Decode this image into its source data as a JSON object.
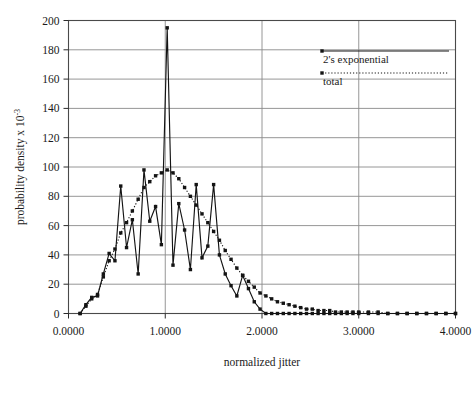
{
  "chart_data": {
    "type": "line",
    "title": "",
    "xlabel": "normalized jitter",
    "ylabel": "probability density x 10-3",
    "ylabel_base": "probability density x  10",
    "ylabel_exp": "-3",
    "xlim": [
      0.0,
      4.0
    ],
    "ylim": [
      0,
      200
    ],
    "xticks": [
      0.0,
      1.0,
      2.0,
      3.0,
      4.0
    ],
    "xtick_labels": [
      "0.0000",
      "1.0000",
      "2.0000",
      "3.0000",
      "4.0000"
    ],
    "yticks": [
      0,
      20,
      40,
      60,
      80,
      100,
      120,
      140,
      160,
      180,
      200
    ],
    "ytick_labels": [
      "0",
      "20",
      "40",
      "60",
      "80",
      "100",
      "120",
      "140",
      "160",
      "180",
      "200"
    ],
    "grid": "both",
    "grid_color": "#8a8a8a",
    "legend_position": "top-right",
    "series": [
      {
        "name": "2's exponential",
        "style": "solid",
        "color": "#141414",
        "marker": "square",
        "points": [
          [
            0.12,
            0
          ],
          [
            0.18,
            6
          ],
          [
            0.24,
            11
          ],
          [
            0.3,
            12
          ],
          [
            0.36,
            27
          ],
          [
            0.42,
            41
          ],
          [
            0.48,
            36
          ],
          [
            0.54,
            87
          ],
          [
            0.6,
            45
          ],
          [
            0.66,
            64
          ],
          [
            0.72,
            27
          ],
          [
            0.78,
            98
          ],
          [
            0.84,
            63
          ],
          [
            0.9,
            73
          ],
          [
            0.96,
            47
          ],
          [
            1.02,
            195
          ],
          [
            1.08,
            33
          ],
          [
            1.14,
            75
          ],
          [
            1.2,
            57
          ],
          [
            1.26,
            30
          ],
          [
            1.32,
            88
          ],
          [
            1.38,
            38
          ],
          [
            1.44,
            46
          ],
          [
            1.5,
            88
          ],
          [
            1.56,
            40
          ],
          [
            1.62,
            27
          ],
          [
            1.68,
            19
          ],
          [
            1.74,
            12
          ],
          [
            1.8,
            26
          ],
          [
            1.86,
            17
          ],
          [
            1.92,
            8
          ],
          [
            1.98,
            3
          ],
          [
            2.04,
            0
          ],
          [
            2.1,
            0
          ],
          [
            2.16,
            0
          ],
          [
            2.22,
            0
          ],
          [
            2.28,
            0
          ],
          [
            2.34,
            0
          ],
          [
            2.4,
            0
          ],
          [
            2.46,
            0
          ],
          [
            2.52,
            0
          ],
          [
            2.58,
            0
          ],
          [
            2.64,
            0
          ],
          [
            2.7,
            0
          ],
          [
            2.76,
            0
          ],
          [
            2.82,
            0
          ],
          [
            2.88,
            0
          ],
          [
            2.94,
            0
          ],
          [
            3.0,
            0
          ],
          [
            3.1,
            0
          ],
          [
            3.2,
            0
          ],
          [
            3.3,
            0
          ],
          [
            3.4,
            0
          ],
          [
            3.5,
            0
          ],
          [
            3.6,
            0
          ],
          [
            3.7,
            0
          ],
          [
            3.8,
            0
          ],
          [
            3.9,
            0
          ],
          [
            4.0,
            0
          ]
        ]
      },
      {
        "name": "total",
        "style": "dotted",
        "color": "#141414",
        "marker": "square",
        "points": [
          [
            0.12,
            0
          ],
          [
            0.18,
            5
          ],
          [
            0.24,
            10
          ],
          [
            0.3,
            13
          ],
          [
            0.36,
            25
          ],
          [
            0.42,
            36
          ],
          [
            0.48,
            44
          ],
          [
            0.54,
            55
          ],
          [
            0.6,
            62
          ],
          [
            0.66,
            70
          ],
          [
            0.72,
            78
          ],
          [
            0.78,
            86
          ],
          [
            0.84,
            90
          ],
          [
            0.9,
            94
          ],
          [
            0.96,
            96
          ],
          [
            1.02,
            98
          ],
          [
            1.08,
            96
          ],
          [
            1.14,
            92
          ],
          [
            1.2,
            86
          ],
          [
            1.26,
            80
          ],
          [
            1.32,
            74
          ],
          [
            1.38,
            68
          ],
          [
            1.44,
            62
          ],
          [
            1.5,
            56
          ],
          [
            1.56,
            50
          ],
          [
            1.62,
            43
          ],
          [
            1.68,
            37
          ],
          [
            1.74,
            31
          ],
          [
            1.8,
            26
          ],
          [
            1.86,
            22
          ],
          [
            1.92,
            18
          ],
          [
            1.98,
            14
          ],
          [
            2.04,
            12
          ],
          [
            2.1,
            10
          ],
          [
            2.16,
            8
          ],
          [
            2.22,
            7
          ],
          [
            2.28,
            6
          ],
          [
            2.34,
            5
          ],
          [
            2.4,
            4
          ],
          [
            2.46,
            3
          ],
          [
            2.52,
            3
          ],
          [
            2.58,
            2
          ],
          [
            2.64,
            2
          ],
          [
            2.7,
            2
          ],
          [
            2.76,
            1
          ],
          [
            2.82,
            1
          ],
          [
            2.88,
            1
          ],
          [
            2.94,
            1
          ],
          [
            3.0,
            1
          ],
          [
            3.1,
            1
          ],
          [
            3.2,
            1
          ],
          [
            3.3,
            0
          ],
          [
            3.4,
            0
          ],
          [
            3.5,
            0
          ],
          [
            3.6,
            0
          ],
          [
            3.7,
            0
          ],
          [
            3.8,
            0
          ],
          [
            3.9,
            0
          ],
          [
            4.0,
            0
          ]
        ]
      }
    ],
    "legend": [
      {
        "label": "2's exponential",
        "style": "solid"
      },
      {
        "label": "total",
        "style": "dotted"
      }
    ]
  }
}
